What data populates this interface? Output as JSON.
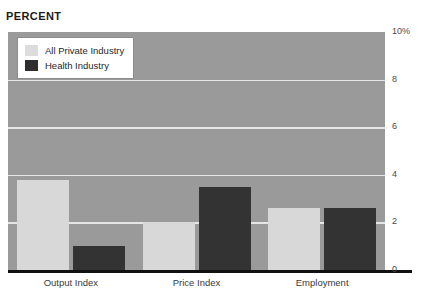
{
  "chart_data": {
    "type": "bar",
    "title": "PERCENT",
    "xlabel": "",
    "ylabel": "PERCENT",
    "categories": [
      "Output Index",
      "Price Index",
      "Employment"
    ],
    "series": [
      {
        "name": "All Private Industry",
        "color": "#d8d8d8",
        "values": [
          3.8,
          2.0,
          2.6
        ]
      },
      {
        "name": "Health Industry",
        "color": "#333333",
        "values": [
          1.0,
          3.5,
          2.6
        ]
      }
    ],
    "ylim": [
      0,
      10
    ],
    "yticks": [
      {
        "value": 10,
        "label": "10%"
      },
      {
        "value": 8,
        "label": "8"
      },
      {
        "value": 6,
        "label": "6"
      },
      {
        "value": 4,
        "label": "4"
      },
      {
        "value": 2,
        "label": "2"
      },
      {
        "value": 0,
        "label": "0"
      }
    ],
    "gridlines": [
      2,
      4,
      6,
      8
    ],
    "grid": true,
    "legend_position": "top-left",
    "plot_background": "#9a9a9a",
    "grid_color": "#e6e6e6",
    "axis_color": "#111111"
  },
  "legend": {
    "items": [
      {
        "label": "All Private Industry",
        "swatch": "light"
      },
      {
        "label": "Health Industry",
        "swatch": "dark"
      }
    ]
  }
}
